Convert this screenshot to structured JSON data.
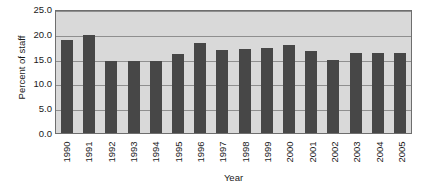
{
  "chart_data": {
    "type": "bar",
    "title": "",
    "xlabel": "Year",
    "ylabel": "Percent of staff",
    "categories": [
      "1990",
      "1991",
      "1992",
      "1993",
      "1994",
      "1995",
      "1996",
      "1997",
      "1998",
      "1999",
      "2000",
      "2001",
      "2002",
      "2003",
      "2004",
      "2005"
    ],
    "values": [
      18.8,
      19.8,
      14.5,
      14.6,
      14.6,
      16.0,
      18.2,
      16.8,
      17.0,
      17.2,
      17.8,
      16.5,
      14.8,
      16.1,
      16.1,
      16.2
    ],
    "ylim": [
      0.0,
      25.0
    ],
    "y_ticks": [
      0.0,
      5.0,
      10.0,
      15.0,
      20.0,
      25.0
    ],
    "y_tick_labels": [
      "0.0",
      "5.0",
      "10.0",
      "15.0",
      "20.0",
      "25.0"
    ],
    "grid": true,
    "grid_axis": "y",
    "legend": false,
    "legend_position": "none",
    "series": [
      {
        "name": "Percent of staff",
        "values": [
          18.8,
          19.8,
          14.5,
          14.6,
          14.6,
          16.0,
          18.2,
          16.8,
          17.0,
          17.2,
          17.8,
          16.5,
          14.8,
          16.1,
          16.1,
          16.2
        ]
      }
    ],
    "colors": {
      "bar": "#474747",
      "plot_background": "#d9d9d9",
      "gridline": "#8f8f8f",
      "axis_border": "#6e6e6e",
      "text": "#1a1a1a",
      "page_background": "#ffffff"
    }
  }
}
